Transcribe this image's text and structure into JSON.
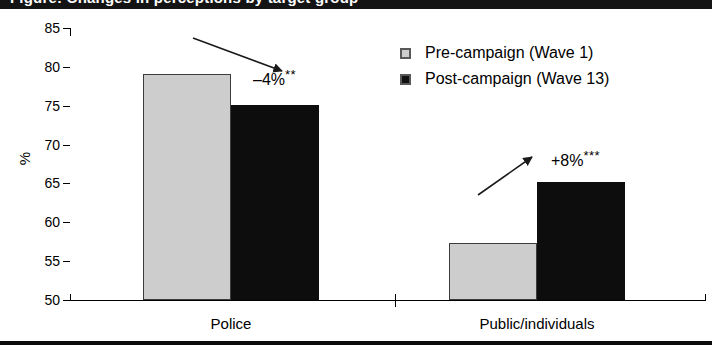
{
  "figure": {
    "title_band_text": "Figure: Changes in perceptions by target group",
    "width": 712,
    "height": 349
  },
  "chart_data": {
    "type": "bar",
    "title": "",
    "xlabel": "",
    "ylabel": "%",
    "ylim": [
      50,
      85
    ],
    "ytick_step": 5,
    "yticks": [
      85,
      80,
      75,
      70,
      65,
      60,
      55,
      50
    ],
    "grid": false,
    "legend_position": "top-right",
    "categories": [
      "Police",
      "Public/individuals"
    ],
    "series": [
      {
        "name": "Pre-campaign (Wave 1)",
        "color": "#cdcdcd",
        "values": [
          79.1,
          57.3
        ]
      },
      {
        "name": "Post-campaign (Wave 13)",
        "color": "#0d0d0d",
        "values": [
          75.1,
          65.2
        ]
      }
    ],
    "annotations": [
      {
        "id": "police-change",
        "text": "–4%",
        "significance": "**",
        "category": "Police",
        "direction": "down"
      },
      {
        "id": "public-change",
        "text": "+8%",
        "significance": "***",
        "category": "Public/individuals",
        "direction": "up"
      }
    ]
  },
  "axis": {
    "y_title": "%"
  },
  "legend": {
    "items": [
      {
        "label": "Pre-campaign (Wave 1)",
        "swatch": "pre"
      },
      {
        "label": "Post-campaign (Wave 13)",
        "swatch": "post"
      }
    ]
  }
}
